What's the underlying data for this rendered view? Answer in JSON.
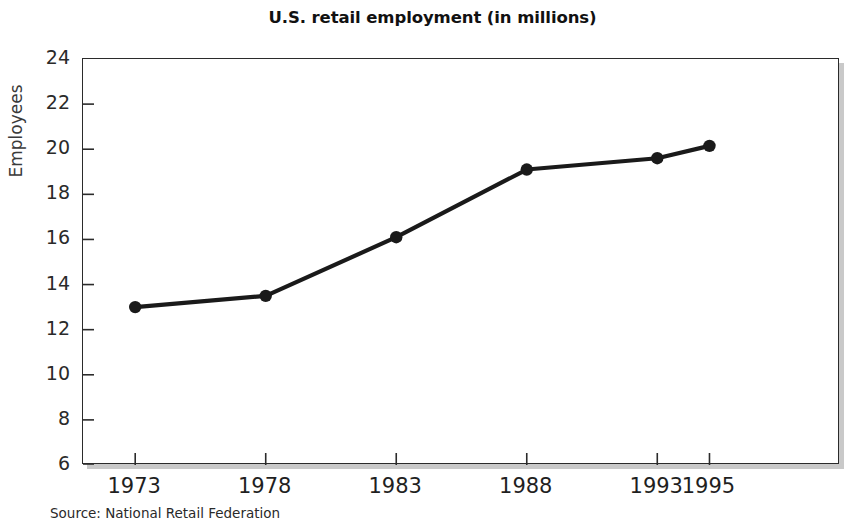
{
  "chart_data": {
    "type": "line",
    "title": "U.S. retail employment (in millions)",
    "xlabel": "",
    "ylabel": "Employees",
    "x": [
      1973,
      1978,
      1983,
      1988,
      1993,
      1995
    ],
    "categories": [
      "1973",
      "1978",
      "1983",
      "1988",
      "1993",
      "1995"
    ],
    "values": [
      13.0,
      13.5,
      16.1,
      19.1,
      19.6,
      20.15
    ],
    "series": [
      {
        "name": "U.S. retail employment",
        "values": [
          13.0,
          13.5,
          16.1,
          19.1,
          19.6,
          20.15
        ]
      }
    ],
    "ylim": [
      6,
      24
    ],
    "xlim": [
      1971,
      2000
    ],
    "y_ticks": [
      6,
      8,
      10,
      12,
      14,
      16,
      18,
      20,
      22,
      24
    ],
    "y_tick_labels": [
      "6",
      "8",
      "10",
      "12",
      "14",
      "16",
      "18",
      "20",
      "22",
      "24"
    ],
    "x_ticks": [
      1973,
      1978,
      1983,
      1988,
      1993,
      1995
    ],
    "x_tick_labels": [
      "1973",
      "1978",
      "1983",
      "1988",
      "1993",
      "1995"
    ],
    "grid": false,
    "legend": "none",
    "marker": "filled-circle",
    "line_color": "#1a1a1a",
    "marker_color": "#1a1a1a",
    "frame_color": "#2b2b2b",
    "background_color": "#ffffff",
    "annotations": []
  },
  "figure": {
    "source_note": "Source: National Retail Federation"
  }
}
